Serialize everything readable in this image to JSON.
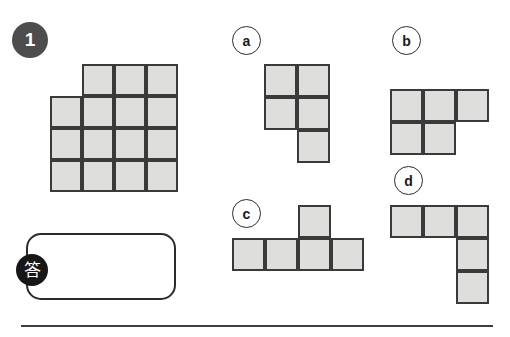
{
  "page": {
    "width": 510,
    "height": 337,
    "background": "#ffffff",
    "cell_fill": "#dededd",
    "cell_stroke": "#3a3a3a",
    "badge_fill": "#4d4d4d",
    "answer_badge_fill": "#171717",
    "rule_color": "#3c3c46"
  },
  "question": {
    "number": "1",
    "badge_name": "question-number-badge"
  },
  "prompt_shape": {
    "name": "prompt-polyomino",
    "cell_size": 32,
    "origin": {
      "x": 50,
      "y": 64
    },
    "cells": [
      {
        "col": 1,
        "row": 0
      },
      {
        "col": 2,
        "row": 0
      },
      {
        "col": 3,
        "row": 0
      },
      {
        "col": 0,
        "row": 1
      },
      {
        "col": 1,
        "row": 1
      },
      {
        "col": 2,
        "row": 1
      },
      {
        "col": 3,
        "row": 1
      },
      {
        "col": 0,
        "row": 2
      },
      {
        "col": 1,
        "row": 2
      },
      {
        "col": 2,
        "row": 2
      },
      {
        "col": 3,
        "row": 2
      },
      {
        "col": 0,
        "row": 3
      },
      {
        "col": 1,
        "row": 3
      },
      {
        "col": 2,
        "row": 3
      },
      {
        "col": 3,
        "row": 3
      }
    ],
    "cell_count": 15
  },
  "answer": {
    "box_name": "answer-input-box",
    "badge_label": "答",
    "value": ""
  },
  "options": [
    {
      "label": "a",
      "circle": {
        "x": 232,
        "y": 26
      },
      "cell_size": 33,
      "origin": {
        "x": 264,
        "y": 64
      },
      "cells": [
        {
          "col": 0,
          "row": 0
        },
        {
          "col": 1,
          "row": 0
        },
        {
          "col": 0,
          "row": 1
        },
        {
          "col": 1,
          "row": 1
        },
        {
          "col": 1,
          "row": 2
        }
      ],
      "cell_count": 5
    },
    {
      "label": "b",
      "circle": {
        "x": 392,
        "y": 26
      },
      "cell_size": 33,
      "origin": {
        "x": 390,
        "y": 89
      },
      "cells": [
        {
          "col": 0,
          "row": 0
        },
        {
          "col": 1,
          "row": 0
        },
        {
          "col": 2,
          "row": 0
        },
        {
          "col": 0,
          "row": 1
        },
        {
          "col": 1,
          "row": 1
        }
      ],
      "cell_count": 5
    },
    {
      "label": "c",
      "circle": {
        "x": 232,
        "y": 199
      },
      "cell_size": 33,
      "origin": {
        "x": 232,
        "y": 205
      },
      "cells": [
        {
          "col": 2,
          "row": 0
        },
        {
          "col": 0,
          "row": 1
        },
        {
          "col": 1,
          "row": 1
        },
        {
          "col": 2,
          "row": 1
        },
        {
          "col": 3,
          "row": 1
        }
      ],
      "cell_count": 5
    },
    {
      "label": "d",
      "circle": {
        "x": 394,
        "y": 166
      },
      "cell_size": 33,
      "origin": {
        "x": 390,
        "y": 205
      },
      "cells": [
        {
          "col": 0,
          "row": 0
        },
        {
          "col": 1,
          "row": 0
        },
        {
          "col": 2,
          "row": 0
        },
        {
          "col": 2,
          "row": 1
        },
        {
          "col": 2,
          "row": 2
        }
      ],
      "cell_count": 5
    }
  ]
}
